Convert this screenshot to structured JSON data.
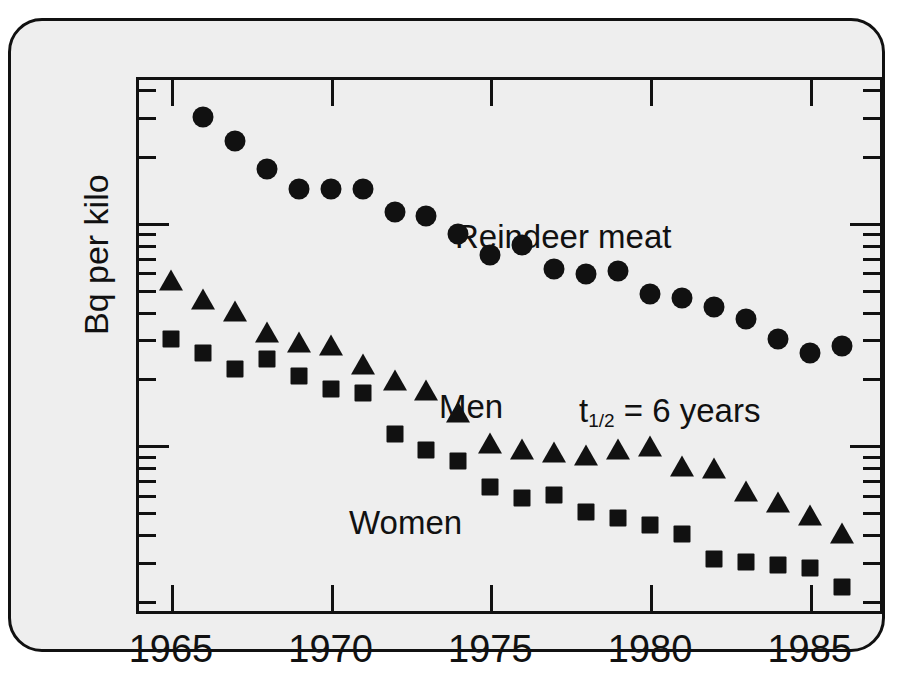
{
  "figure": {
    "background_color": "#eeeeee",
    "frame_color": "#111111",
    "y_axis_title": "Bq per kilo"
  },
  "annotations": {
    "reindeer": "Reindeer meat",
    "men": "Men",
    "women": "Women",
    "halflife_prefix": "t",
    "halflife_sub": "1/2",
    "halflife_rest": " = 6 years"
  },
  "chart_data": {
    "type": "scatter",
    "title": "",
    "xlabel": "",
    "ylabel": "Bq per kilo",
    "xlim": [
      1964.0,
      1987.2
    ],
    "ylim": [
      18,
      4400
    ],
    "yscale": "log",
    "grid": false,
    "legend": "inline-annotations",
    "xticks": [
      1965,
      1970,
      1975,
      1980,
      1985
    ],
    "xtick_labels": [
      "1965",
      "1970",
      "1975",
      "1980",
      "1985"
    ],
    "yticks": [
      100,
      1000
    ],
    "ytick_labels": [
      "100",
      "1000"
    ],
    "yminor_ticks": [
      20,
      30,
      40,
      50,
      60,
      70,
      80,
      90,
      200,
      300,
      400,
      500,
      600,
      700,
      800,
      900,
      2000,
      3000,
      4000
    ],
    "series": [
      {
        "name": "Reindeer meat",
        "marker": "circle",
        "color": "#111111",
        "x": [
          1966,
          1967,
          1968,
          1969,
          1970,
          1971,
          1972,
          1973,
          1974,
          1975,
          1976,
          1977,
          1978,
          1979,
          1980,
          1981,
          1982,
          1983,
          1984,
          1985,
          1986
        ],
        "y": [
          3000,
          2350,
          1750,
          1420,
          1420,
          1420,
          1120,
          1080,
          890,
          720,
          800,
          620,
          590,
          610,
          480,
          460,
          420,
          370,
          300,
          260,
          280
        ]
      },
      {
        "name": "Men",
        "marker": "triangle",
        "color": "#111111",
        "x": [
          1965,
          1966,
          1967,
          1968,
          1969,
          1970,
          1971,
          1972,
          1973,
          1974,
          1975,
          1976,
          1977,
          1978,
          1979,
          1980,
          1981,
          1982,
          1983,
          1984,
          1985,
          1986
        ],
        "y": [
          550,
          450,
          400,
          320,
          290,
          280,
          230,
          195,
          175,
          140,
          102,
          95,
          92,
          90,
          95,
          98,
          80,
          78,
          62,
          55,
          48,
          40
        ]
      },
      {
        "name": "Women",
        "marker": "square",
        "color": "#111111",
        "x": [
          1965,
          1966,
          1967,
          1968,
          1969,
          1970,
          1971,
          1972,
          1973,
          1974,
          1975,
          1976,
          1977,
          1978,
          1979,
          1980,
          1981,
          1982,
          1983,
          1984,
          1985,
          1986
        ],
        "y": [
          300,
          260,
          220,
          245,
          205,
          180,
          172,
          112,
          95,
          85,
          65,
          58,
          60,
          50,
          47,
          44,
          40,
          31,
          30,
          29,
          28,
          23
        ]
      }
    ]
  }
}
